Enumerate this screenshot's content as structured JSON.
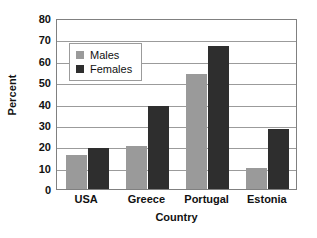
{
  "chart_data": {
    "type": "bar",
    "title": "",
    "subtitle": "",
    "xlabel": "Country",
    "ylabel": "Percent",
    "categories": [
      "USA",
      "Greece",
      "Portugal",
      "Estonia"
    ],
    "series": [
      {
        "name": "Males",
        "color": "#9a9a9a",
        "values": [
          16,
          20,
          54,
          10
        ]
      },
      {
        "name": "Females",
        "color": "#2e2e2e",
        "values": [
          19,
          39,
          67,
          28
        ]
      }
    ],
    "ylim": [
      0,
      80
    ],
    "ytick_step": 10,
    "yticks": [
      0,
      10,
      20,
      30,
      40,
      50,
      60,
      70,
      80
    ],
    "ytick_labels": [
      "0",
      "10",
      "20",
      "30",
      "40",
      "50",
      "60",
      "70",
      "80"
    ],
    "grid": true,
    "grid_axis": "y",
    "legend_position": "upper-left-inside",
    "annotations": []
  },
  "legend": {
    "entries": [
      {
        "label": "Males",
        "swatch": "males-swatch"
      },
      {
        "label": "Females",
        "swatch": "females-swatch"
      }
    ]
  },
  "axes": {
    "y_title": "Percent",
    "x_title": "Country"
  }
}
